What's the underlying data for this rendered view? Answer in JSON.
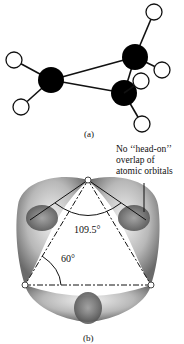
{
  "figure": {
    "panel_a": {
      "label": "(a)",
      "description": "Ball-and-stick model of cyclopropane",
      "carbons": [
        {
          "id": "C1",
          "x": 51,
          "y": 80
        },
        {
          "id": "C2",
          "x": 135,
          "y": 57
        },
        {
          "id": "C3",
          "x": 124,
          "y": 93
        }
      ],
      "hydrogens": [
        {
          "id": "H1",
          "x": 14,
          "y": 60,
          "bonded_to": "C1"
        },
        {
          "id": "H2",
          "x": 21,
          "y": 107,
          "bonded_to": "C1"
        },
        {
          "id": "H3",
          "x": 154,
          "y": 12,
          "bonded_to": "C2"
        },
        {
          "id": "H4",
          "x": 162,
          "y": 70,
          "bonded_to": "C2"
        },
        {
          "id": "H5",
          "x": 141,
          "y": 81,
          "bonded_to": "C3"
        },
        {
          "id": "H6",
          "x": 142,
          "y": 124,
          "bonded_to": "C3"
        }
      ]
    },
    "panel_b": {
      "label": "(b)",
      "description": "Bent (banana) bonds in cyclopropane orbital overlap",
      "angle_tetrahedral": "109.5°",
      "angle_ring": "60°",
      "annotation_lines": [
        "No ‘‘head-on’’",
        "overlap of",
        "atomic orbitals"
      ],
      "colors": {
        "orbital_dark": "#555555",
        "orbital_light": "#e0e0e0"
      }
    }
  }
}
